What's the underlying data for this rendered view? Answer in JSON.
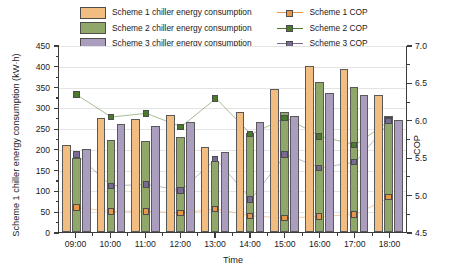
{
  "colors": {
    "scheme1": "#f2bd80",
    "scheme2": "#8fa86a",
    "scheme3": "#ab9dbd",
    "scheme1_marker": "#e8964a",
    "scheme2_marker": "#4a7a2b",
    "scheme3_marker": "#7a6b96",
    "axis": "#3c3c3c",
    "grid": "#e4e4e4",
    "background": "#ffffff"
  },
  "legend": {
    "bars": [
      {
        "label": "Scheme 1 chiller energy consumption",
        "swatch": "scheme1"
      },
      {
        "label": "Scheme 2 chiller energy consumption",
        "swatch": "scheme2"
      },
      {
        "label": "Scheme 3 chiller energy consumption",
        "swatch": "scheme3"
      }
    ],
    "lines": [
      {
        "label": "Scheme 1 COP",
        "swatch": "scheme1_marker"
      },
      {
        "label": "Scheme 2 COP",
        "swatch": "scheme2_marker"
      },
      {
        "label": "Scheme 3 COP",
        "swatch": "scheme3_marker"
      }
    ]
  },
  "axes": {
    "x_title": "Time",
    "y_left_title": "Scheme 1 chiller energy consumption (kW·h)",
    "y_right_title": "COP",
    "y_left_ticks": [
      "0",
      "50",
      "100",
      "150",
      "200",
      "250",
      "300",
      "350",
      "400",
      "450"
    ],
    "y_right_ticks": [
      "4.5",
      "5.0",
      "5.5",
      "6.0",
      "6.5",
      "7.0"
    ],
    "x_ticks": [
      "09:00",
      "10:00",
      "11:00",
      "12:00",
      "13:00",
      "14:00",
      "15:00",
      "16:00",
      "17:00",
      "18:00"
    ]
  },
  "chart_data": {
    "type": "bar",
    "title": "",
    "subtitle": "",
    "xlabel": "Time",
    "ylabel": "Scheme 1 chiller energy consumption (kW·h)",
    "y2label": "COP",
    "ylim": [
      0,
      450
    ],
    "y2lim": [
      4.5,
      7.0
    ],
    "ytick_step": 50,
    "y2tick_step": 0.5,
    "grid": true,
    "legend_position": "top",
    "categories": [
      "09:00",
      "10:00",
      "11:00",
      "12:00",
      "13:00",
      "14:00",
      "15:00",
      "16:00",
      "17:00",
      "18:00"
    ],
    "series": [
      {
        "name": "Scheme 1 chiller energy consumption",
        "kind": "bar",
        "axis": "left",
        "unit": "kW·h",
        "values": [
          210,
          275,
          272,
          282,
          205,
          290,
          345,
          400,
          392,
          330
        ]
      },
      {
        "name": "Scheme 2 chiller energy consumption",
        "kind": "bar",
        "axis": "left",
        "unit": "kW·h",
        "values": [
          178,
          222,
          220,
          228,
          172,
          238,
          288,
          360,
          348,
          278
        ]
      },
      {
        "name": "Scheme 3 chiller energy consumption",
        "kind": "bar",
        "axis": "left",
        "unit": "kW·h",
        "values": [
          200,
          260,
          256,
          265,
          192,
          265,
          278,
          335,
          330,
          270
        ]
      },
      {
        "name": "Scheme 1 COP",
        "kind": "line",
        "axis": "right",
        "unit": "",
        "values": [
          4.84,
          4.79,
          4.79,
          4.77,
          4.82,
          4.73,
          4.7,
          4.72,
          4.75,
          4.98
        ]
      },
      {
        "name": "Scheme 2 COP",
        "kind": "line",
        "axis": "right",
        "unit": "",
        "values": [
          6.35,
          6.05,
          6.1,
          5.92,
          6.3,
          5.82,
          6.04,
          5.79,
          5.68,
          6.01
        ]
      },
      {
        "name": "Scheme 3 COP",
        "kind": "line",
        "axis": "right",
        "unit": "",
        "values": [
          5.55,
          5.13,
          5.15,
          5.07,
          5.49,
          4.95,
          5.55,
          5.37,
          5.45,
          6.0
        ]
      }
    ]
  }
}
